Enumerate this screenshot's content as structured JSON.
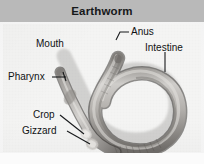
{
  "figure": {
    "title": "Earthworm",
    "kind": "labeled anatomy photograph"
  },
  "colors": {
    "header_background": "#b9b9b9",
    "header_text": "#16181a",
    "photo_background": "#f4f4f3",
    "label_text": "#101214",
    "leader_line": "#1a1c1e",
    "worm_body_light": "#cfcdca",
    "worm_body_mid": "#9e9b97",
    "worm_body_dark": "#5f5c59",
    "worm_outline": "#3a3836"
  },
  "labels": [
    {
      "id": "mouth",
      "text": "Mouth",
      "x": 36,
      "y": 38
    },
    {
      "id": "anus",
      "text": "Anus",
      "x": 131,
      "y": 28
    },
    {
      "id": "intestine",
      "text": "Intestine",
      "x": 146,
      "y": 44
    },
    {
      "id": "pharynx",
      "text": "Pharynx",
      "x": 9,
      "y": 72
    },
    {
      "id": "crop",
      "text": "Crop",
      "x": 34,
      "y": 110
    },
    {
      "id": "gizzard",
      "text": "Gizzard",
      "x": 24,
      "y": 126
    }
  ],
  "leaders": [
    {
      "id": "mouth-leader",
      "points": "63,50 66,58"
    },
    {
      "id": "anus-leader",
      "points": "130,32 122,30 118,36"
    },
    {
      "id": "intestine-leader",
      "points": "164,56 164,70"
    },
    {
      "id": "pharynx-leader",
      "points": "55,78 68,78"
    },
    {
      "id": "crop-leader",
      "points": "61,115 84,115"
    },
    {
      "id": "gizzard-leader",
      "points": "65,130 88,130"
    }
  ]
}
